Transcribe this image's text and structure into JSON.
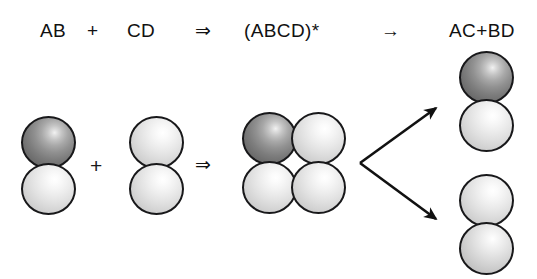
{
  "figure": {
    "background_color": "#ffffff",
    "width": 537,
    "height": 279,
    "type": "reaction-scheme-diagram"
  },
  "equation": {
    "reactant_a_label": "AB",
    "plus_label": "+",
    "reactant_b_label": "CD",
    "double_arrow_label": "⇒",
    "complex_label": "(ABCD)*",
    "single_arrow_label": "→",
    "products_label": "AC+BD"
  },
  "operators_molecule_row": {
    "plus_label": "+",
    "double_arrow_label": "⇒"
  },
  "molecules": {
    "reactant_ab": {
      "name": "AB",
      "atoms": [
        {
          "id": "A",
          "shade": "dark"
        },
        {
          "id": "B",
          "shade": "light"
        }
      ]
    },
    "reactant_cd": {
      "name": "CD",
      "atoms": [
        {
          "id": "C",
          "shade": "light"
        },
        {
          "id": "D",
          "shade": "light"
        }
      ]
    },
    "complex_abcd": {
      "name": "(ABCD)*",
      "atoms": [
        {
          "id": "A",
          "shade": "dark"
        },
        {
          "id": "C",
          "shade": "light"
        },
        {
          "id": "B",
          "shade": "light"
        },
        {
          "id": "D",
          "shade": "light"
        }
      ]
    },
    "product_ac": {
      "name": "AC",
      "atoms": [
        {
          "id": "A",
          "shade": "dark"
        },
        {
          "id": "C",
          "shade": "light"
        }
      ]
    },
    "product_bd": {
      "name": "BD",
      "atoms": [
        {
          "id": "B",
          "shade": "light"
        },
        {
          "id": "D",
          "shade": "light2"
        }
      ]
    }
  },
  "branch_arrows": {
    "count": 2,
    "origin": {
      "x": 360,
      "y": 163
    },
    "upper_tip": {
      "x": 439,
      "y": 106
    },
    "lower_tip": {
      "x": 439,
      "y": 221
    },
    "color": "#111111"
  },
  "colors": {
    "outline": "#18181a",
    "text": "#111111",
    "dark_atom_mid": "#8a8a8a",
    "light_atom_mid": "#e2e2e2"
  }
}
